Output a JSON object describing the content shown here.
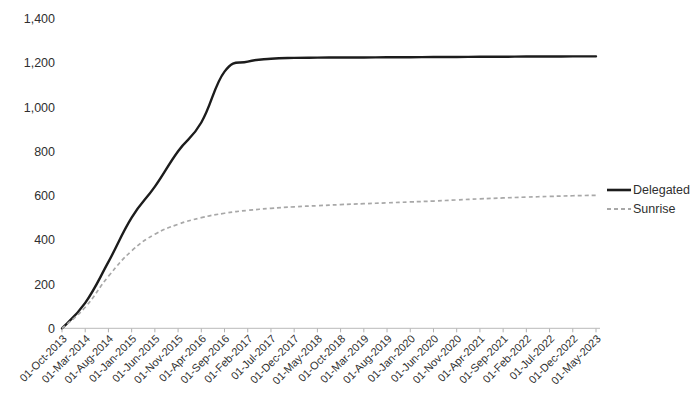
{
  "chart_data": {
    "type": "line",
    "title": "",
    "subtitle": "",
    "xlabel": "",
    "ylabel": "",
    "ylim": [
      0,
      1400
    ],
    "yticks": [
      0,
      200,
      400,
      600,
      800,
      1000,
      1200,
      1400
    ],
    "ytick_labels": [
      "0",
      "200",
      "400",
      "600",
      "800",
      "1,000",
      "1,200",
      "1,400"
    ],
    "grid": false,
    "legend_position": "right",
    "categories": [
      "01-Oct-2013",
      "01-Mar-2014",
      "01-Aug-2014",
      "01-Jan-2015",
      "01-Jun-2015",
      "01-Nov-2015",
      "01-Apr-2016",
      "01-Sep-2016",
      "01-Feb-2017",
      "01-Jul-2017",
      "01-Dec-2017",
      "01-May-2018",
      "01-Oct-2018",
      "01-Mar-2019",
      "01-Aug-2019",
      "01-Jan-2020",
      "01-Jun-2020",
      "01-Nov-2020",
      "01-Apr-2021",
      "01-Sep-2021",
      "01-Feb-2022",
      "01-Jul-2022",
      "01-Dec-2022",
      "01-May-2023"
    ],
    "series": [
      {
        "name": "Delegated",
        "color": "#1c1c1c",
        "style": "solid",
        "values": [
          0,
          115,
          300,
          500,
          640,
          800,
          930,
          1160,
          1205,
          1218,
          1222,
          1223,
          1224,
          1224,
          1225,
          1225,
          1226,
          1226,
          1227,
          1227,
          1228,
          1228,
          1229,
          1229
        ]
      },
      {
        "name": "Sunrise",
        "color": "#a8a8a8",
        "style": "dashed",
        "values": [
          0,
          95,
          235,
          350,
          425,
          470,
          500,
          520,
          533,
          542,
          549,
          554,
          559,
          563,
          567,
          571,
          575,
          580,
          585,
          589,
          593,
          596,
          599,
          601
        ]
      }
    ]
  },
  "legend": {
    "items": [
      {
        "label": "Delegated"
      },
      {
        "label": "Sunrise"
      }
    ]
  }
}
